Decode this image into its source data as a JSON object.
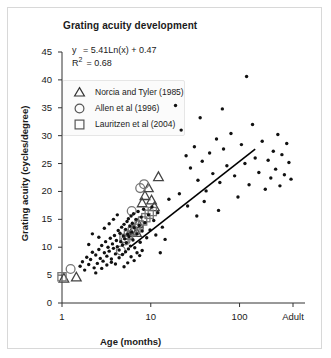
{
  "chart_data": {
    "type": "scatter",
    "title": "Grating acuity development",
    "xlabel": "Age (months)",
    "ylabel": "Grating acuity (cycles/degree)",
    "xscale": "log",
    "xticks": [
      "1",
      "10",
      "100",
      "Adult"
    ],
    "xtick_values": [
      1,
      10,
      100,
      400
    ],
    "yticks": [
      "0",
      "5",
      "10",
      "15",
      "20",
      "25",
      "30",
      "35",
      "40",
      "45"
    ],
    "ylim": [
      0,
      45
    ],
    "grid": false,
    "annotations": {
      "equation_y_label": "y",
      "equation": "= 5.41Ln(x) + 0.47",
      "r2_label": "R",
      "r2_sup": "2",
      "r2_value": "= 0.68"
    },
    "fit": {
      "type": "logarithmic",
      "slope": 5.41,
      "intercept": 0.47,
      "r2": 0.68,
      "x_start": 6.0,
      "x_end": 150.0
    },
    "legend": {
      "position": "upper-left",
      "entries": [
        {
          "label": "Norcia and Tyler (1985)",
          "marker": "triangle"
        },
        {
          "label": "Allen et al (1996)",
          "marker": "circle"
        },
        {
          "label": "Lauritzen et al (2004)",
          "marker": "square"
        }
      ]
    },
    "series": [
      {
        "name": "Norcia and Tyler (1985)",
        "marker": "triangle",
        "points": [
          [
            1.05,
            4.4
          ],
          [
            1.45,
            4.6
          ],
          [
            5.6,
            12.1
          ],
          [
            6.3,
            13.0
          ],
          [
            7.2,
            14.2
          ],
          [
            8.0,
            17.9
          ],
          [
            8.6,
            19.2
          ],
          [
            9.4,
            20.6
          ],
          [
            10.2,
            18.4
          ],
          [
            11.0,
            17.2
          ],
          [
            12.2,
            22.6
          ],
          [
            6.9,
            12.6
          ]
        ]
      },
      {
        "name": "Allen et al (1996)",
        "marker": "circle",
        "points": [
          [
            1.25,
            6.1
          ],
          [
            5.2,
            11.2
          ],
          [
            6.1,
            16.5
          ],
          [
            7.6,
            20.6
          ],
          [
            8.4,
            21.3
          ],
          [
            4.6,
            9.4
          ]
        ]
      },
      {
        "name": "Lauritzen et al (2004)",
        "marker": "square",
        "points": [
          [
            1.0,
            4.7
          ],
          [
            5.0,
            11.6
          ],
          [
            5.6,
            12.2
          ],
          [
            6.2,
            12.8
          ],
          [
            6.8,
            13.4
          ],
          [
            7.4,
            14.0
          ],
          [
            8.1,
            14.7
          ],
          [
            8.8,
            15.3
          ],
          [
            9.6,
            15.9
          ],
          [
            10.4,
            16.4
          ]
        ]
      },
      {
        "name": "Individual observations",
        "marker": "dot",
        "points": [
          [
            1.6,
            6.6
          ],
          [
            1.7,
            7.4
          ],
          [
            1.8,
            5.9
          ],
          [
            1.9,
            8.2
          ],
          [
            2.0,
            6.9
          ],
          [
            2.1,
            7.8
          ],
          [
            2.2,
            9.1
          ],
          [
            2.3,
            6.3
          ],
          [
            2.4,
            8.6
          ],
          [
            2.5,
            7.1
          ],
          [
            2.6,
            9.6
          ],
          [
            2.7,
            8.0
          ],
          [
            2.8,
            10.3
          ],
          [
            2.9,
            7.5
          ],
          [
            3.0,
            9.0
          ],
          [
            3.1,
            11.0
          ],
          [
            3.2,
            8.4
          ],
          [
            3.3,
            10.0
          ],
          [
            3.4,
            9.3
          ],
          [
            3.5,
            11.6
          ],
          [
            3.6,
            7.9
          ],
          [
            3.7,
            10.6
          ],
          [
            3.8,
            9.8
          ],
          [
            3.9,
            12.1
          ],
          [
            4.0,
            8.8
          ],
          [
            4.1,
            11.2
          ],
          [
            4.2,
            10.1
          ],
          [
            4.3,
            13.0
          ],
          [
            4.4,
            9.5
          ],
          [
            4.5,
            12.5
          ],
          [
            4.6,
            11.0
          ],
          [
            4.7,
            13.6
          ],
          [
            4.8,
            10.4
          ],
          [
            4.9,
            12.0
          ],
          [
            5.0,
            14.1
          ],
          [
            5.1,
            11.5
          ],
          [
            5.2,
            13.2
          ],
          [
            5.3,
            10.8
          ],
          [
            5.4,
            14.6
          ],
          [
            5.5,
            12.3
          ],
          [
            5.6,
            15.1
          ],
          [
            5.7,
            11.9
          ],
          [
            5.8,
            13.8
          ],
          [
            5.9,
            10.2
          ],
          [
            6.0,
            15.6
          ],
          [
            6.1,
            12.7
          ],
          [
            6.2,
            14.3
          ],
          [
            6.3,
            11.3
          ],
          [
            6.4,
            16.0
          ],
          [
            6.5,
            13.5
          ],
          [
            6.6,
            9.9
          ],
          [
            6.8,
            15.0
          ],
          [
            7.0,
            12.4
          ],
          [
            7.2,
            16.4
          ],
          [
            7.4,
            13.9
          ],
          [
            7.6,
            10.9
          ],
          [
            7.8,
            15.4
          ],
          [
            8.0,
            12.9
          ],
          [
            8.3,
            16.8
          ],
          [
            8.6,
            14.4
          ],
          [
            9.0,
            11.7
          ],
          [
            9.4,
            15.8
          ],
          [
            9.8,
            13.1
          ],
          [
            10.3,
            17.2
          ],
          [
            10.8,
            14.8
          ],
          [
            11.4,
            12.2
          ],
          [
            12.0,
            16.2
          ],
          [
            2.2,
            12.4
          ],
          [
            2.6,
            11.8
          ],
          [
            3.0,
            13.4
          ],
          [
            3.4,
            14.2
          ],
          [
            3.8,
            15.0
          ],
          [
            4.2,
            15.8
          ],
          [
            2.0,
            10.5
          ],
          [
            2.4,
            5.4
          ],
          [
            2.8,
            6.2
          ],
          [
            3.2,
            6.8
          ],
          [
            3.6,
            7.3
          ],
          [
            4.0,
            7.0
          ],
          [
            4.4,
            8.1
          ],
          [
            4.8,
            8.7
          ],
          [
            5.2,
            9.2
          ],
          [
            5.6,
            9.7
          ],
          [
            6.0,
            8.3
          ],
          [
            6.5,
            7.6
          ],
          [
            7.0,
            9.0
          ],
          [
            7.5,
            8.5
          ],
          [
            8.0,
            9.4
          ],
          [
            5.0,
            6.5
          ],
          [
            5.5,
            7.2
          ],
          [
            13.5,
            13.6
          ],
          [
            14.5,
            11.4
          ],
          [
            16.0,
            18.6
          ],
          [
            12.8,
            9.0
          ],
          [
            22.0,
            31.0
          ],
          [
            25.0,
            26.4
          ],
          [
            28.0,
            24.2
          ],
          [
            31.0,
            28.0
          ],
          [
            34.0,
            22.0
          ],
          [
            38.0,
            25.4
          ],
          [
            42.0,
            20.1
          ],
          [
            46.0,
            26.9
          ],
          [
            50.0,
            23.2
          ],
          [
            55.0,
            29.4
          ],
          [
            60.0,
            21.6
          ],
          [
            66.0,
            27.6
          ],
          [
            72.0,
            24.6
          ],
          [
            80.0,
            30.4
          ],
          [
            88.0,
            22.8
          ],
          [
            96.0,
            19.0
          ],
          [
            105.0,
            28.4
          ],
          [
            115.0,
            25.0
          ],
          [
            120.0,
            40.6
          ],
          [
            128.0,
            21.2
          ],
          [
            140.0,
            32.0
          ],
          [
            150.0,
            26.0
          ],
          [
            165.0,
            23.4
          ],
          [
            180.0,
            29.0
          ],
          [
            195.0,
            20.4
          ],
          [
            210.0,
            25.6
          ],
          [
            225.0,
            22.4
          ],
          [
            240.0,
            27.2
          ],
          [
            255.0,
            24.0
          ],
          [
            270.0,
            30.2
          ],
          [
            285.0,
            21.0
          ],
          [
            300.0,
            26.6
          ],
          [
            320.0,
            23.0
          ],
          [
            340.0,
            28.6
          ],
          [
            360.0,
            25.2
          ],
          [
            380.0,
            22.2
          ],
          [
            21.0,
            19.6
          ],
          [
            26.0,
            17.4
          ],
          [
            33.0,
            15.6
          ],
          [
            40.0,
            18.2
          ],
          [
            58.0,
            16.6
          ],
          [
            19.0,
            35.4
          ],
          [
            36.0,
            33.2
          ],
          [
            64.0,
            34.8
          ]
        ]
      }
    ]
  }
}
